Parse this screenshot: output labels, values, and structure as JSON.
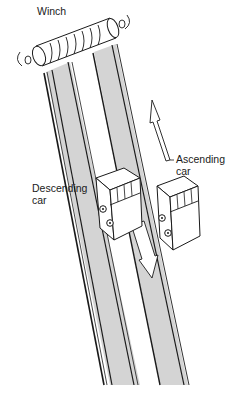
{
  "diagram": {
    "type": "funicular-railway",
    "labels": {
      "winch": "Winch",
      "ascending_l1": "Ascending",
      "ascending_l2": "car",
      "descending_l1": "Descending",
      "descending_l2": "car"
    },
    "colors": {
      "track_fill": "#d4d4d4",
      "line": "#1a1a1a",
      "background": "#ffffff"
    },
    "arrows": {
      "ascending": "up",
      "descending": "down"
    }
  }
}
